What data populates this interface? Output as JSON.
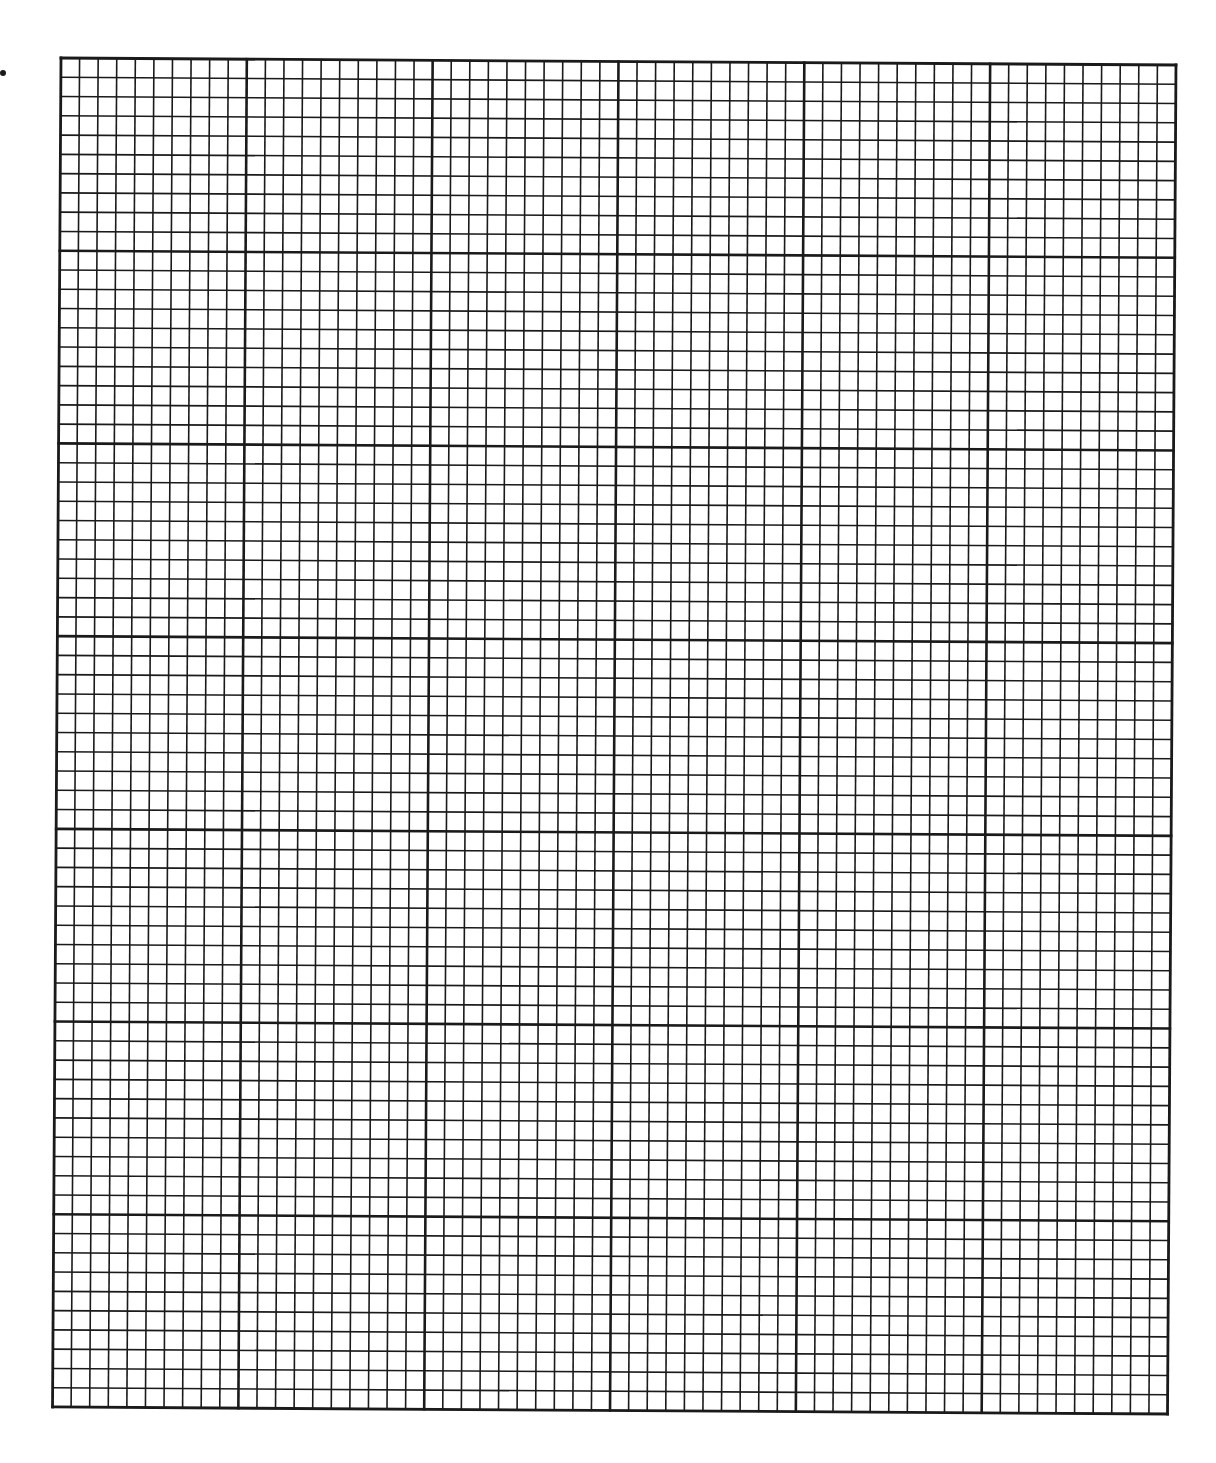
{
  "sheet": {
    "type": "graph-paper",
    "major_columns": 6,
    "major_rows": 7,
    "minor_per_major": 10,
    "minor_columns": 60,
    "minor_rows": 70,
    "line_color": "#1a1a1a",
    "background": "#ffffff",
    "minor_stroke": 1.6,
    "major_stroke": 2.6,
    "border_stroke": 2.8
  },
  "geometry": {
    "origin_x": 61,
    "origin_y": 58,
    "width": 1115,
    "height": 1349,
    "rotation_deg": 0.36
  },
  "marks": [
    {
      "type": "dot",
      "x": 3,
      "y": 73
    }
  ]
}
